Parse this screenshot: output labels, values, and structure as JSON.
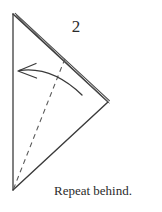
{
  "figure": {
    "type": "origami-step-diagram",
    "background_color": "#ffffff",
    "ink_color": "#3a3a3a",
    "text_color": "#2b2b2b",
    "step_number": "2",
    "caption": "Repeat behind.",
    "shape": {
      "name": "folded-triangle",
      "vertices": {
        "top_left": [
          13,
          14
        ],
        "bottom_left": [
          13,
          190
        ],
        "right": [
          107,
          101
        ]
      },
      "edges": [
        {
          "name": "left-edge-vertical",
          "from": [
            13,
            14
          ],
          "to": [
            13,
            190
          ],
          "style": "solid",
          "layers": 1
        },
        {
          "name": "upper-right-edge",
          "from": [
            13,
            14
          ],
          "to": [
            107,
            101
          ],
          "style": "solid",
          "layers": 3
        },
        {
          "name": "lower-right-edge",
          "from": [
            13,
            190
          ],
          "to": [
            107,
            101
          ],
          "style": "solid",
          "layers": 1
        }
      ],
      "fold_line": {
        "name": "valley-fold-dashed",
        "from": [
          13,
          190
        ],
        "to": [
          66,
          56
        ],
        "style": "dashed",
        "dash_pattern": "5 4"
      },
      "arrow": {
        "name": "fold-direction-arrow",
        "direction": "left",
        "tip": [
          18,
          71
        ],
        "tail": [
          82,
          95
        ],
        "control": [
          52,
          66
        ],
        "head_style": "open-barbed"
      }
    }
  }
}
